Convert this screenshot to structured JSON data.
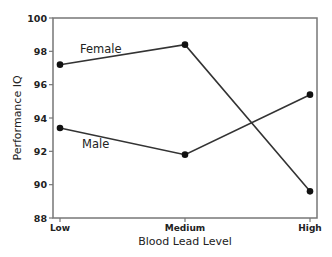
{
  "chart_data": {
    "type": "line",
    "title": "",
    "xlabel": "Blood Lead Level",
    "ylabel": "Performance IQ",
    "categories": [
      "Low",
      "Medium",
      "High"
    ],
    "ylim": [
      88,
      100
    ],
    "yticks": [
      88,
      90,
      92,
      94,
      96,
      98,
      100
    ],
    "ytick_labels": [
      "88",
      "90",
      "92",
      "94",
      "96",
      "98",
      "100"
    ],
    "grid": false,
    "legend": "inline labels",
    "series": [
      {
        "name": "Female",
        "values": [
          97.2,
          98.4,
          89.6
        ],
        "color": "#333333"
      },
      {
        "name": "Male",
        "values": [
          93.4,
          91.8,
          95.4
        ],
        "color": "#333333"
      }
    ]
  }
}
